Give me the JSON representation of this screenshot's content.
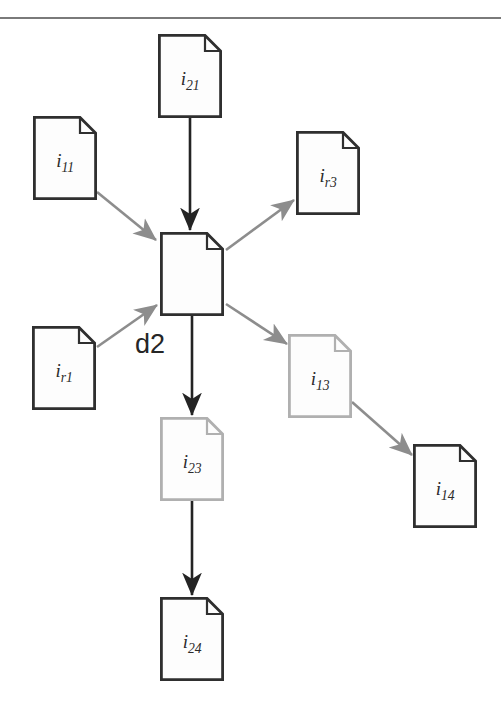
{
  "diagram": {
    "background_color": "#ffffff",
    "center_tag": "d2",
    "colors": {
      "dark_stroke": "#2f2f2f",
      "light_stroke": "#b0b0b0",
      "dark_arrow": "#242424",
      "gray_arrow": "#8d8d8d",
      "paper_fill": "#fdfdfd",
      "label_text": "#2b2b2b",
      "artifact": "#7a7a7a"
    },
    "nodes": [
      {
        "id": "i21",
        "base": "i",
        "sub": "21",
        "label": "i21",
        "x": 158,
        "y": 34,
        "w": 64,
        "h": 84,
        "tone": "dark",
        "labeled": true
      },
      {
        "id": "i11",
        "base": "i",
        "sub": "11",
        "label": "i11",
        "x": 33,
        "y": 116,
        "w": 64,
        "h": 84,
        "tone": "dark",
        "labeled": true
      },
      {
        "id": "ir3",
        "base": "i",
        "sub": "r3",
        "label": "ir3",
        "x": 296,
        "y": 131,
        "w": 64,
        "h": 84,
        "tone": "dark",
        "labeled": true
      },
      {
        "id": "center",
        "base": "",
        "sub": "",
        "label": "",
        "x": 160,
        "y": 232,
        "w": 64,
        "h": 84,
        "tone": "dark",
        "labeled": false
      },
      {
        "id": "ir1",
        "base": "i",
        "sub": "r1",
        "label": "ir1",
        "x": 32,
        "y": 326,
        "w": 64,
        "h": 84,
        "tone": "dark",
        "labeled": true
      },
      {
        "id": "i13",
        "base": "i",
        "sub": "13",
        "label": "i13",
        "x": 288,
        "y": 334,
        "w": 64,
        "h": 84,
        "tone": "light",
        "labeled": true
      },
      {
        "id": "i23",
        "base": "i",
        "sub": "23",
        "label": "i23",
        "x": 160,
        "y": 417,
        "w": 64,
        "h": 84,
        "tone": "light",
        "labeled": true
      },
      {
        "id": "i14",
        "base": "i",
        "sub": "14",
        "label": "i14",
        "x": 413,
        "y": 444,
        "w": 64,
        "h": 84,
        "tone": "dark",
        "labeled": true
      },
      {
        "id": "i24",
        "base": "i",
        "sub": "24",
        "label": "i24",
        "x": 160,
        "y": 597,
        "w": 64,
        "h": 84,
        "tone": "dark",
        "labeled": true
      }
    ],
    "edges": [
      {
        "id": "i21-center",
        "from": "i21",
        "to": "center",
        "tone": "dark"
      },
      {
        "id": "i11-center",
        "from": "i11",
        "to": "center",
        "tone": "gray"
      },
      {
        "id": "ir1-center",
        "from": "ir1",
        "to": "center",
        "tone": "gray"
      },
      {
        "id": "center-ir3",
        "from": "center",
        "to": "ir3",
        "tone": "gray"
      },
      {
        "id": "center-i13",
        "from": "center",
        "to": "i13",
        "tone": "gray"
      },
      {
        "id": "center-i23",
        "from": "center",
        "to": "i23",
        "tone": "dark"
      },
      {
        "id": "i23-i24",
        "from": "i23",
        "to": "i24",
        "tone": "dark"
      },
      {
        "id": "i13-i14",
        "from": "i13",
        "to": "i14",
        "tone": "gray"
      }
    ]
  }
}
